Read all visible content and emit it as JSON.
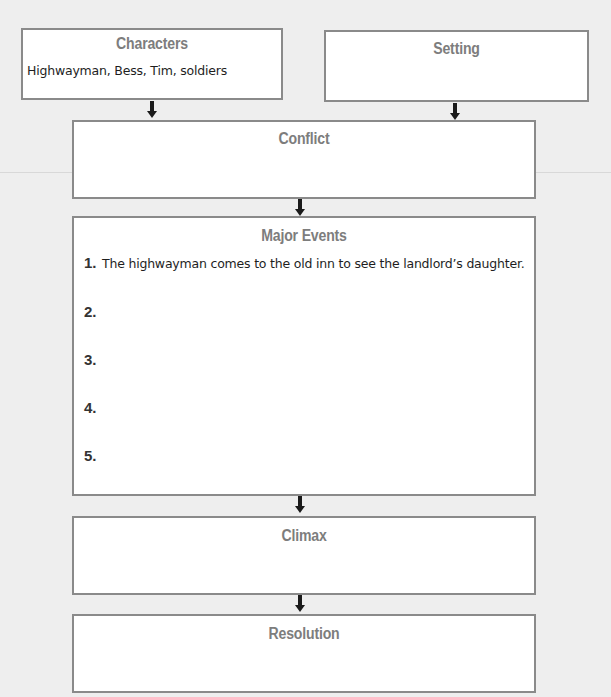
{
  "organizer": {
    "characters": {
      "heading": "Characters",
      "content": "Highwayman, Bess, Tim, soldiers"
    },
    "setting": {
      "heading": "Setting",
      "content": ""
    },
    "conflict": {
      "heading": "Conflict",
      "content": ""
    },
    "major_events": {
      "heading": "Major Events",
      "items": [
        {
          "number": "1.",
          "text": "The highwayman comes to the old inn to see the landlord’s daughter."
        },
        {
          "number": "2.",
          "text": ""
        },
        {
          "number": "3.",
          "text": ""
        },
        {
          "number": "4.",
          "text": ""
        },
        {
          "number": "5.",
          "text": ""
        }
      ]
    },
    "climax": {
      "heading": "Climax",
      "content": ""
    },
    "resolution": {
      "heading": "Resolution",
      "content": ""
    }
  },
  "colors": {
    "background": "#eeeeee",
    "box_fill": "#ffffff",
    "box_border": "#8a8a8a",
    "heading_text": "#7d7d7d",
    "arrow": "#1a1a1a"
  }
}
